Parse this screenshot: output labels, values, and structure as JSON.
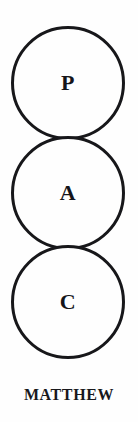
{
  "diagram": {
    "type": "stacked-tangent-circles",
    "orientation": "vertical",
    "caption": "MATTHEW",
    "circle_count": 3,
    "stroke_color": "#17171a",
    "fill_color": "#fefefe",
    "text_color": "#15151a",
    "background_color": "#fefefe",
    "nodes": [
      {
        "label": "P",
        "order": 1,
        "name": "circle-p"
      },
      {
        "label": "A",
        "order": 2,
        "name": "circle-a"
      },
      {
        "label": "C",
        "order": 3,
        "name": "circle-c"
      }
    ]
  }
}
